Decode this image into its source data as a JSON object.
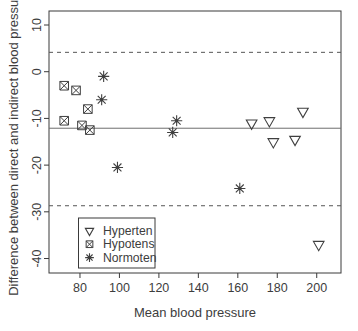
{
  "style": {
    "background": "#ffffff",
    "ink": "#3a3a3a",
    "text_color": "#3d3d3d",
    "marker_color": "#3f3f3f",
    "mean_line_color": "#6e6e6e",
    "limit_line_color": "#565656"
  },
  "chart_data": {
    "type": "scatter",
    "title": "",
    "xlabel": "Mean blood pressure",
    "ylabel": "Difference between direct and indirect blood pressure",
    "xlim": [
      64.3,
      212.3
    ],
    "ylim": [
      -43.1,
      13.0
    ],
    "x_ticks": [
      80,
      100,
      120,
      140,
      160,
      180,
      200
    ],
    "y_ticks": [
      10,
      0,
      -10,
      -20,
      -30,
      -40
    ],
    "grid": false,
    "legend_position": "bottom-left",
    "series": [
      {
        "name": "Hyperten",
        "marker": "triangle-down",
        "points": [
          [
            167,
            -11
          ],
          [
            176,
            -10.5
          ],
          [
            178,
            -15
          ],
          [
            189,
            -14.5
          ],
          [
            193,
            -8.5
          ],
          [
            201,
            -37
          ]
        ]
      },
      {
        "name": "Hypotens",
        "marker": "square-x",
        "points": [
          [
            72,
            -3
          ],
          [
            78,
            -4
          ],
          [
            84,
            -8
          ],
          [
            72,
            -10.5
          ],
          [
            81,
            -11.5
          ],
          [
            85,
            -12.5
          ]
        ]
      },
      {
        "name": "Normoten",
        "marker": "asterisk",
        "points": [
          [
            92,
            -1
          ],
          [
            91,
            -6
          ],
          [
            99,
            -20.5
          ],
          [
            127,
            -13
          ],
          [
            129,
            -10.5
          ],
          [
            161,
            -25
          ]
        ]
      }
    ],
    "reference_lines": [
      {
        "value": -12.1,
        "style": "solid",
        "role": "mean"
      },
      {
        "value": 4.15,
        "style": "dashed",
        "role": "upper-limit"
      },
      {
        "value": -28.7,
        "style": "dashed",
        "role": "lower-limit"
      }
    ],
    "legend": {
      "entries": [
        {
          "label": "Hyperten",
          "marker": "triangle-down"
        },
        {
          "label": "Hypotens",
          "marker": "square-x"
        },
        {
          "label": "Normoten",
          "marker": "asterisk"
        }
      ]
    }
  }
}
